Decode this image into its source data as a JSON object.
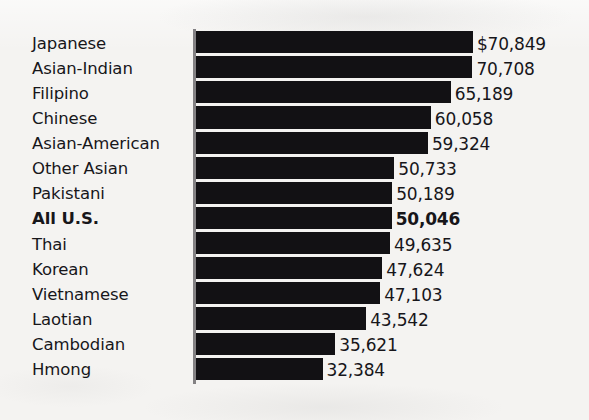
{
  "chart_data": {
    "type": "bar",
    "orientation": "horizontal",
    "title": "",
    "subtitle": "",
    "xlabel": "",
    "ylabel": "",
    "grid": false,
    "legend": null,
    "axis_origin": 0,
    "value_prefix_first_only": "$",
    "xlim": [
      0,
      70849
    ],
    "categories": [
      "Japanese",
      "Asian-Indian",
      "Filipino",
      "Chinese",
      "Asian-American",
      "Other Asian",
      "Pakistani",
      "All U.S.",
      "Thai",
      "Korean",
      "Vietnamese",
      "Laotian",
      "Cambodian",
      "Hmong"
    ],
    "values": [
      70849,
      70708,
      65189,
      60058,
      59324,
      50733,
      50189,
      50046,
      49635,
      47624,
      47103,
      43542,
      35621,
      32384
    ],
    "value_labels": [
      "$70,849",
      "70,708",
      "65,189",
      "60,058",
      "59,324",
      "50,733",
      "50,189",
      "50,046",
      "49,635",
      "47,624",
      "47,103",
      "43,542",
      "35,621",
      "32,384"
    ],
    "emphasis_index": 7,
    "colors": {
      "bar": "#121114",
      "background": "#f4f3f1",
      "text": "#17161a",
      "axis_rule": "#6e6c70"
    }
  }
}
